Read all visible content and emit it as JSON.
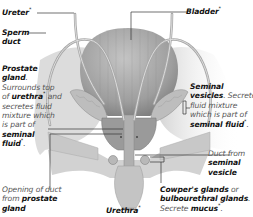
{
  "diagram": {
    "labels": {
      "ureter": {
        "name": "Ureter",
        "marker": "*"
      },
      "bladder": {
        "name": "Bladder",
        "marker": "*"
      },
      "sperm_duct": {
        "line1": "Sperm",
        "line2": "duct"
      },
      "prostate": {
        "name1": "Prostate",
        "name2": "gland",
        "punct": ".",
        "desc1": "Surrounds top",
        "desc2a": "of ",
        "desc2b": "urethra",
        "desc2c": " and",
        "desc3": "secretes fluid",
        "desc4": "mixture which",
        "desc5": "is part of",
        "desc6": "seminal",
        "desc7": "fluid",
        "marker": "*",
        "end": "."
      },
      "seminal_vesicles": {
        "name1": "Seminal",
        "name2": "vesicles",
        "punct": ".",
        "desc1": " Secrete",
        "desc2": "fluid mixture",
        "desc3": "which is part of",
        "desc4": "seminal fluid",
        "marker": "*",
        "end": "."
      },
      "duct_from_vesicle": {
        "line1": "Duct from",
        "line2": "seminal",
        "line3": "vesicle"
      },
      "prostate_opening": {
        "line1": "Opening of duct",
        "line2a": "from ",
        "line2b": "prostate",
        "line3": "gland"
      },
      "urethra": {
        "name": "Urethra",
        "marker": "*"
      },
      "cowpers": {
        "name1": "Cowper's glands",
        "or": " or",
        "name2": "bulbourethral glands",
        "punct": ".",
        "desc1": "Secrete ",
        "desc2": "mucus",
        "marker": "*",
        "end": "."
      }
    },
    "colors": {
      "bladder": "#a9a9a9",
      "body": "#cfcfcf",
      "duct": "#b5b5b5",
      "line": "#333333",
      "text": "#222222"
    }
  }
}
